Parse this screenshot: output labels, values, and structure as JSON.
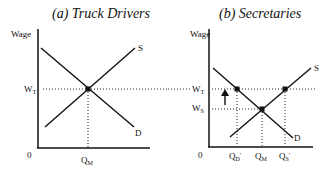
{
  "panels": [
    {
      "title": "(a)  Truck Drivers",
      "y_axis_label": "Wage",
      "origin_label": "0",
      "wage_labels": {
        "wt": "W",
        "wt_sub": "T"
      },
      "quantity_labels": {
        "qm": "Q",
        "qm_sub": "M"
      },
      "curve_labels": {
        "supply": "S",
        "demand": "D"
      }
    },
    {
      "title": "(b) Secretaries",
      "y_axis_label": "Wage",
      "origin_label": "0",
      "wage_labels": {
        "wt": "W",
        "wt_sub": "T",
        "ws": "W",
        "ws_sub": "S"
      },
      "quantity_labels": {
        "qd": "Q",
        "qd_sub": "D",
        "qd_prime": "′",
        "qm": "Q",
        "qm_sub": "M",
        "qs": "Q",
        "qs_sub": "S",
        "qs_prime": "′"
      },
      "curve_labels": {
        "supply": "S",
        "demand": "D"
      }
    }
  ],
  "colors": {
    "line": "#111111",
    "background": "#ffffff"
  }
}
